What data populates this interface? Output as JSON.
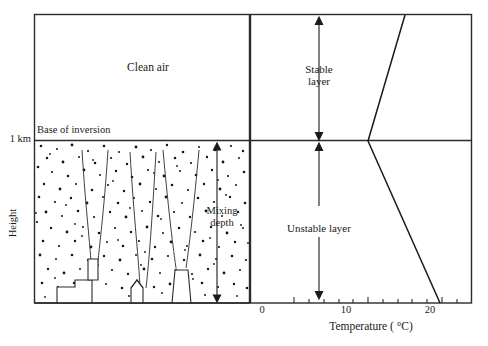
{
  "figure": {
    "left_panel": {
      "clean_air_label": "Clean air",
      "base_of_inversion_label": "Base of inversion",
      "mixing_depth_label_line1": "Mixing",
      "mixing_depth_label_line2": "depth",
      "y_axis_label": "Height",
      "y_tick_label": "1 km"
    },
    "right_panel": {
      "stable_layer_label_line1": "Stable",
      "stable_layer_label_line2": "layer",
      "unstable_layer_label": "Unstable layer"
    }
  },
  "chart_data": {
    "type": "line",
    "title": "",
    "xlabel": "Temperature ( °C)",
    "ylabel": "Height",
    "xlim": [
      -5,
      25
    ],
    "ylim": [
      0,
      1.55
    ],
    "grid": false,
    "legend": null,
    "xticks": [
      -4,
      -2,
      0,
      2,
      4,
      6,
      8,
      10,
      12,
      14,
      16,
      18,
      20,
      22,
      24
    ],
    "xtick_labels": [
      {
        "value": 0,
        "label": "0"
      },
      {
        "value": 10,
        "label": "10"
      },
      {
        "value": 20,
        "label": "20"
      }
    ],
    "yticks": [
      {
        "value": 1.0,
        "label": "1 km"
      }
    ],
    "series": [
      {
        "name": "Temperature profile",
        "comment": "Inversion: temperature rises with height above 1 km; below 1 km it falls with height.",
        "points": [
          {
            "temperature": 20,
            "height": 0.0
          },
          {
            "temperature": 10,
            "height": 1.0
          },
          {
            "temperature": 14.5,
            "height": 1.55
          }
        ]
      }
    ],
    "annotations": [
      {
        "text": "Clean air",
        "region": "above inversion"
      },
      {
        "text": "Base of inversion",
        "height": 1.0
      },
      {
        "text": "Mixing depth",
        "span_height": [
          0.0,
          1.0
        ]
      },
      {
        "text": "Stable layer",
        "span_height": [
          1.0,
          1.55
        ]
      },
      {
        "text": "Unstable layer",
        "span_height": [
          0.0,
          1.0
        ]
      }
    ]
  }
}
